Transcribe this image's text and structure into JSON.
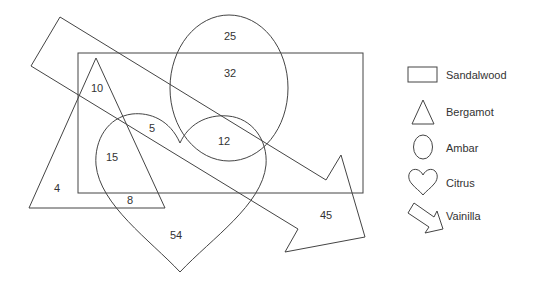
{
  "diagram": {
    "type": "venn",
    "regions": [
      {
        "id": "ambar-only",
        "value": "25"
      },
      {
        "id": "ambar-sandalwood",
        "value": "32"
      },
      {
        "id": "bergamot-sandalwood-vainilla",
        "value": "10"
      },
      {
        "id": "citrus-sandalwood-vainilla",
        "value": "5"
      },
      {
        "id": "ambar-citrus-sandalwood",
        "value": "12"
      },
      {
        "id": "bergamot-citrus-sandalwood",
        "value": "15"
      },
      {
        "id": "bergamot-only",
        "value": "4"
      },
      {
        "id": "bergamot-citrus",
        "value": "8"
      },
      {
        "id": "citrus-only",
        "value": "54"
      },
      {
        "id": "vainilla-only",
        "value": "45"
      }
    ]
  },
  "legend": {
    "items": [
      {
        "shape": "rectangle",
        "label": "Sandalwood"
      },
      {
        "shape": "triangle",
        "label": "Bergamot"
      },
      {
        "shape": "ellipse",
        "label": "Ambar"
      },
      {
        "shape": "heart",
        "label": "Citrus"
      },
      {
        "shape": "arrow",
        "label": "Vainilla"
      }
    ]
  }
}
